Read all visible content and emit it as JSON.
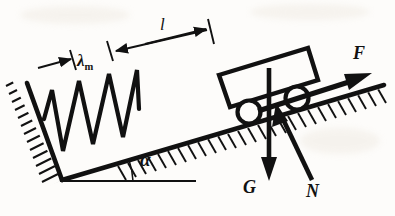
{
  "figure": {
    "background_color": "#fdfcfa",
    "ink_color": "#111111"
  },
  "labels": {
    "spring_extension": "λ",
    "spring_extension_sub": "m",
    "length": "l",
    "angle": "α",
    "force_applied": "F",
    "force_weight": "G",
    "force_normal": "N"
  },
  "geometry": {
    "incline_angle_deg": 17,
    "incline_base_left": [
      62,
      180
    ],
    "incline_base_right": [
      195,
      180
    ],
    "incline_surface_start": [
      62,
      180
    ],
    "incline_surface_end": [
      383,
      86
    ],
    "wall_top": [
      27,
      83
    ],
    "wall_bottom": [
      62,
      180
    ]
  },
  "elements": {
    "wall": "hatched-fixed-wall",
    "incline": "hatched-inclined-surface",
    "spring": "zigzag-spring",
    "spring_peaks": 4,
    "cart": "rectangular-cart-body",
    "wheels": 2,
    "baseline": "horizontal-reference-line",
    "angle_arc": "angle-arc-alpha"
  },
  "dimensions": {
    "lambda_m": {
      "description": "spring extension dimension, left arrow to tick",
      "tick_positions": [
        [
          72,
          58
        ],
        [
          110,
          48
        ]
      ]
    },
    "l": {
      "description": "cart distance dimension, double arrow between ticks",
      "tick_positions": [
        [
          112,
          46
        ],
        [
          212,
          22
        ]
      ]
    }
  },
  "vectors": {
    "F": {
      "from": [
        262,
        108
      ],
      "to": [
        372,
        73
      ],
      "style": "thick-solid-arrow"
    },
    "G": {
      "from": [
        270,
        70
      ],
      "to": [
        269,
        178
      ],
      "style": "thick-down-arrow"
    },
    "N": {
      "from": [
        313,
        180
      ],
      "to": [
        277,
        104
      ],
      "style": "thick-up-left-arrow"
    }
  }
}
